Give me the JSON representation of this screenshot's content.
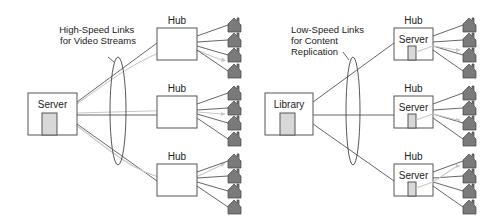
{
  "left_diagram": {
    "source_label": "Server",
    "caption_lines": [
      "High-Speed Links",
      "for Video Streams"
    ],
    "hubs": [
      {
        "label": "Hub",
        "inner_label": ""
      },
      {
        "label": "Hub",
        "inner_label": ""
      },
      {
        "label": "Hub",
        "inner_label": ""
      }
    ],
    "homes_per_hub": 4
  },
  "right_diagram": {
    "source_label": "Library",
    "caption_lines": [
      "Low-Speed Links",
      "for Content",
      "Replication"
    ],
    "hubs": [
      {
        "label": "Hub",
        "inner_label": "Server"
      },
      {
        "label": "Hub",
        "inner_label": "Server"
      },
      {
        "label": "Hub",
        "inner_label": "Server"
      }
    ],
    "homes_per_hub": 4
  },
  "icons": {
    "home": "house-icon",
    "storage": "disk-icon"
  },
  "colors": {
    "line": "#555555",
    "stream": "#c8c8c8",
    "house_fill": "#7a7a7a",
    "door_fill": "#d8d8d8"
  }
}
